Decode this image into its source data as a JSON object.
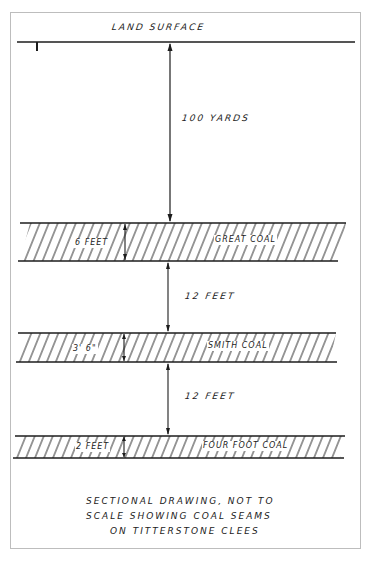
{
  "diagram": {
    "type": "geological-section",
    "surface": {
      "label": "LAND SURFACE"
    },
    "depth_to_first_seam": {
      "label": "100 YARDS"
    },
    "seams": [
      {
        "name": "GREAT COAL",
        "thickness": "6 FEET"
      },
      {
        "name": "SMITH COAL",
        "thickness": "3' 6\""
      },
      {
        "name": "FOUR FOOT COAL",
        "thickness": "2 FEET"
      }
    ],
    "gaps": [
      {
        "label": "12 FEET"
      },
      {
        "label": "12 FEET"
      }
    ],
    "caption": {
      "line1": "SECTIONAL   DRAWING,  NOT  TO",
      "line2": "SCALE   SHOWING   COAL   SEAMS",
      "line3": "ON  TITTERSTONE   CLEES"
    },
    "colors": {
      "ink": "#1c1c1c",
      "paper": "#ffffff",
      "frame": "#bdbdbd"
    }
  }
}
